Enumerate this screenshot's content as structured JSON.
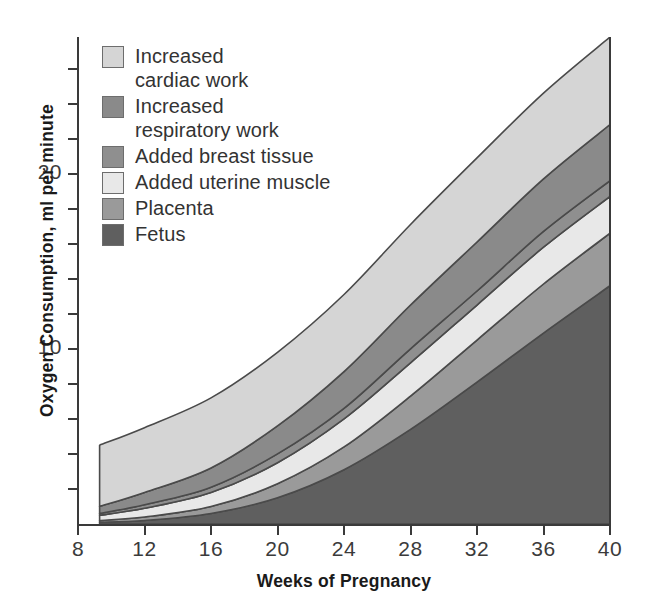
{
  "chart_data": {
    "type": "area",
    "title": "",
    "xlabel": "Weeks of Pregnancy",
    "ylabel": "Oxygen Consumption, ml per minute",
    "xlim": [
      8,
      40
    ],
    "ylim": [
      0,
      27.8
    ],
    "xticks": [
      8,
      12,
      16,
      20,
      24,
      28,
      32,
      36,
      40
    ],
    "yticks": [
      10,
      20
    ],
    "y_minor_tick_step": 2,
    "grid": false,
    "stacked": true,
    "legend_position": "upper-left-inside",
    "x": [
      9.3,
      12,
      16,
      20,
      24,
      28,
      32,
      36,
      40
    ],
    "series": [
      {
        "name": "Fetus",
        "color": "#5f5f5f",
        "values": [
          0.1,
          0.2,
          0.6,
          1.5,
          3.1,
          5.4,
          8.1,
          10.9,
          13.6
        ]
      },
      {
        "name": "Placenta",
        "color": "#9a9a9a",
        "values": [
          0.1,
          0.2,
          0.4,
          0.8,
          1.3,
          1.9,
          2.4,
          2.8,
          3.0
        ]
      },
      {
        "name": "Added uterine muscle",
        "color": "#e8e8e8",
        "values": [
          0.3,
          0.5,
          0.8,
          1.2,
          1.6,
          1.9,
          2.0,
          2.1,
          2.1
        ]
      },
      {
        "name": "Added breast tissue",
        "color": "#8f8f8f",
        "values": [
          0.1,
          0.2,
          0.3,
          0.5,
          0.6,
          0.8,
          0.8,
          0.9,
          0.9
        ]
      },
      {
        "name": "Increased respiratory work",
        "color": "#8a8a8a",
        "values": [
          0.4,
          0.7,
          1.1,
          1.6,
          2.1,
          2.5,
          2.8,
          3.0,
          3.2
        ]
      },
      {
        "name": "Increased cardiac work",
        "color": "#d5d5d5",
        "values": [
          3.5,
          3.7,
          4.0,
          4.2,
          4.4,
          4.6,
          4.8,
          4.9,
          5.0
        ]
      }
    ]
  },
  "axes": {
    "y_title": "Oxygen Consumption, ml per minute",
    "x_title": "Weeks of Pregnancy",
    "y_tick_labels": [
      "10",
      "20"
    ],
    "x_tick_labels": [
      "8",
      "12",
      "16",
      "20",
      "24",
      "28",
      "32",
      "36",
      "40"
    ]
  },
  "legend": {
    "items": [
      {
        "label": "Increased\ncardiac work",
        "swatch": "#d5d5d5"
      },
      {
        "label": "Increased\nrespiratory work",
        "swatch": "#8a8a8a"
      },
      {
        "label": "Added breast tissue",
        "swatch": "#8f8f8f"
      },
      {
        "label": "Added uterine muscle",
        "swatch": "#e8e8e8"
      },
      {
        "label": "Placenta",
        "swatch": "#9a9a9a"
      },
      {
        "label": "Fetus",
        "swatch": "#5f5f5f"
      }
    ]
  },
  "colors": {
    "axis": "#3a3a3a",
    "text": "#2b2b2b",
    "band_outline": "#4a4a4a",
    "background": "#ffffff"
  }
}
